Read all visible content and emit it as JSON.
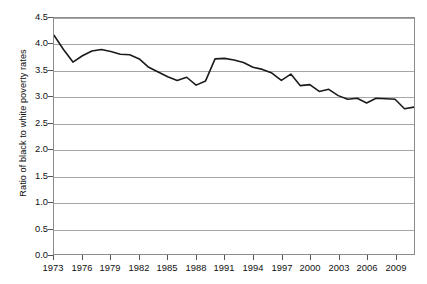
{
  "chart_data": {
    "type": "line",
    "title": "",
    "xlabel": "",
    "ylabel": "Ratio of black to white poverty rates",
    "ylim": [
      0.0,
      4.5
    ],
    "xlim": [
      1973,
      2011
    ],
    "ytick_labels": [
      "0.0",
      "0.5",
      "1.0",
      "1.5",
      "2.0",
      "2.5",
      "3.0",
      "3.5",
      "4.0",
      "4.5"
    ],
    "ytick_values": [
      0.0,
      0.5,
      1.0,
      1.5,
      2.0,
      2.5,
      3.0,
      3.5,
      4.0,
      4.5
    ],
    "xtick_labels": [
      "1973",
      "1976",
      "1979",
      "1982",
      "1985",
      "1988",
      "1991",
      "1994",
      "1997",
      "2000",
      "2003",
      "2006",
      "2009"
    ],
    "xtick_values": [
      1973,
      1976,
      1979,
      1982,
      1985,
      1988,
      1991,
      1994,
      1997,
      2000,
      2003,
      2006,
      2009
    ],
    "grid": "horizontal",
    "legend": "none",
    "line_color": "#1a1a1a",
    "grid_color": "#a6a6a6",
    "frame_color": "#8c8c8c",
    "x": [
      1973,
      1974,
      1975,
      1976,
      1977,
      1978,
      1979,
      1980,
      1981,
      1982,
      1983,
      1984,
      1985,
      1986,
      1987,
      1988,
      1989,
      1990,
      1991,
      1992,
      1993,
      1994,
      1995,
      1996,
      1997,
      1998,
      1999,
      2000,
      2001,
      2002,
      2003,
      2004,
      2005,
      2006,
      2007,
      2008,
      2009,
      2010,
      2011
    ],
    "values": [
      4.17,
      3.9,
      3.66,
      3.78,
      3.87,
      3.9,
      3.86,
      3.81,
      3.8,
      3.72,
      3.56,
      3.47,
      3.38,
      3.31,
      3.37,
      3.22,
      3.3,
      3.72,
      3.73,
      3.7,
      3.65,
      3.56,
      3.52,
      3.45,
      3.31,
      3.43,
      3.21,
      3.23,
      3.1,
      3.14,
      3.02,
      2.95,
      2.97,
      2.88,
      2.97,
      2.96,
      2.95,
      2.77,
      2.8
    ],
    "series": [
      {
        "name": "Ratio of black to white poverty rates",
        "values": [
          4.17,
          3.9,
          3.66,
          3.78,
          3.87,
          3.9,
          3.86,
          3.81,
          3.8,
          3.72,
          3.56,
          3.47,
          3.38,
          3.31,
          3.37,
          3.22,
          3.3,
          3.72,
          3.73,
          3.7,
          3.65,
          3.56,
          3.52,
          3.45,
          3.31,
          3.43,
          3.21,
          3.23,
          3.1,
          3.14,
          3.02,
          2.95,
          2.97,
          2.88,
          2.97,
          2.96,
          2.95,
          2.77,
          2.8
        ]
      }
    ]
  }
}
